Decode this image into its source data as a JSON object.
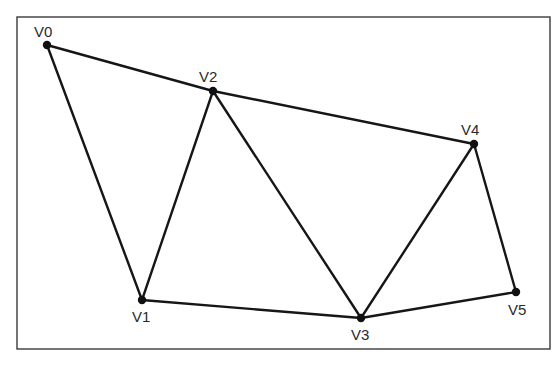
{
  "diagram": {
    "type": "graph",
    "frame": {
      "x": 17,
      "y": 17,
      "width": 533,
      "height": 332
    },
    "colors": {
      "edge": "#161616",
      "vertex": "#111111",
      "label": "#2a2a2a",
      "frame": "#3a3a3a",
      "background": "#ffffff"
    },
    "vertices": [
      {
        "id": "V0",
        "label": "V0",
        "x": 47,
        "y": 45,
        "lx": 34,
        "ly": 37
      },
      {
        "id": "V1",
        "label": "V1",
        "x": 142,
        "y": 300,
        "lx": 132,
        "ly": 322
      },
      {
        "id": "V2",
        "label": "V2",
        "x": 213,
        "y": 91,
        "lx": 199,
        "ly": 82
      },
      {
        "id": "V3",
        "label": "V3",
        "x": 361,
        "y": 318,
        "lx": 351,
        "ly": 340
      },
      {
        "id": "V4",
        "label": "V4",
        "x": 474,
        "y": 144,
        "lx": 461,
        "ly": 135
      },
      {
        "id": "V5",
        "label": "V5",
        "x": 516,
        "y": 292,
        "lx": 508,
        "ly": 315
      }
    ],
    "edges": [
      [
        "V0",
        "V2"
      ],
      [
        "V2",
        "V4"
      ],
      [
        "V0",
        "V1"
      ],
      [
        "V1",
        "V2"
      ],
      [
        "V2",
        "V3"
      ],
      [
        "V1",
        "V3"
      ],
      [
        "V3",
        "V4"
      ],
      [
        "V4",
        "V5"
      ],
      [
        "V3",
        "V5"
      ]
    ]
  }
}
